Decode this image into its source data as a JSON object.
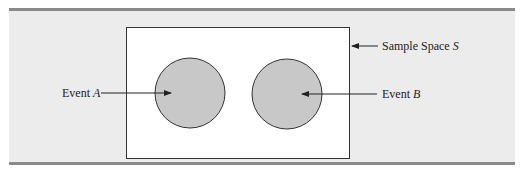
{
  "figure": {
    "type": "venn-diagram",
    "colors": {
      "panel_background": "#ececec",
      "sample_space_fill": "#ffffff",
      "event_fill": "#c8c8c8",
      "outline": "#333333",
      "rule_bars": "#8a8a8a"
    },
    "sample_space": {
      "label": "Sample Space",
      "symbol": "S"
    },
    "events": [
      {
        "label": "Event",
        "symbol": "A"
      },
      {
        "label": "Event",
        "symbol": "B"
      }
    ]
  }
}
